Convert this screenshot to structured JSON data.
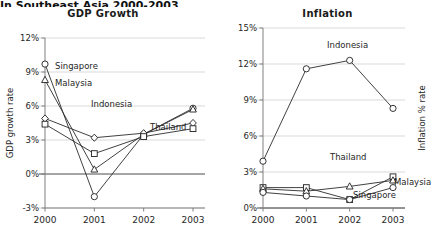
{
  "page": {
    "cut_off_header": "In Southeast Asia  2000-2003"
  },
  "charts": [
    {
      "id": "gdp",
      "title": "GDP Growth",
      "ylabel": "GDP growth rate",
      "xticks": [
        "2000",
        "2001",
        "2002",
        "2003"
      ],
      "yticks": [
        "12%",
        "9%",
        "6%",
        "3%",
        "0%",
        "-3%"
      ],
      "labels": {
        "singapore": "Singapore",
        "malaysia": "Malaysia",
        "indonesia": "Indonesia",
        "thailand": "Thailand"
      }
    },
    {
      "id": "inflation",
      "title": "Inflation",
      "ylabel": "Inflation % rate",
      "xticks": [
        "2000",
        "2001",
        "2002",
        "2003"
      ],
      "yticks": [
        "15%",
        "12%",
        "9%",
        "6%",
        "3%",
        "0%"
      ],
      "labels": {
        "indonesia": "Indonesia",
        "thailand": "Thailand",
        "malaysia": "Malaysia",
        "singapore": "Singapore"
      }
    }
  ],
  "chart_data": [
    {
      "type": "line",
      "id": "gdp",
      "title": "GDP Growth",
      "xlabel": "",
      "ylabel": "GDP growth rate",
      "x": [
        "2000",
        "2001",
        "2002",
        "2003"
      ],
      "ylim": [
        -3,
        12
      ],
      "ytick_values": [
        12,
        9,
        6,
        3,
        0,
        -3
      ],
      "grid": true,
      "legend": "inline-labels",
      "series": [
        {
          "name": "Singapore",
          "marker": "circle",
          "values": [
            9.7,
            -2.0,
            3.5,
            5.8
          ]
        },
        {
          "name": "Malaysia",
          "marker": "triangle",
          "values": [
            8.3,
            0.4,
            3.5,
            5.7
          ]
        },
        {
          "name": "Indonesia",
          "marker": "diamond",
          "values": [
            4.9,
            3.2,
            3.6,
            4.5
          ]
        },
        {
          "name": "Thailand",
          "marker": "square",
          "values": [
            4.4,
            1.8,
            3.3,
            4.0
          ]
        }
      ]
    },
    {
      "type": "line",
      "id": "inflation",
      "title": "Inflation",
      "xlabel": "",
      "ylabel": "Inflation % rate",
      "x": [
        "2000",
        "2001",
        "2002",
        "2003"
      ],
      "ylim": [
        0,
        15
      ],
      "ytick_values": [
        15,
        12,
        9,
        6,
        3,
        0
      ],
      "grid": true,
      "legend": "inline-labels",
      "series": [
        {
          "name": "Indonesia",
          "marker": "circle",
          "values": [
            3.9,
            11.6,
            12.3,
            8.3
          ]
        },
        {
          "name": "Thailand",
          "marker": "square",
          "values": [
            1.7,
            1.7,
            0.7,
            2.6
          ]
        },
        {
          "name": "Malaysia",
          "marker": "triangle",
          "values": [
            1.6,
            1.4,
            1.8,
            2.3
          ]
        },
        {
          "name": "Singapore",
          "marker": "circle",
          "values": [
            1.3,
            1.0,
            0.7,
            1.7
          ]
        }
      ]
    }
  ]
}
